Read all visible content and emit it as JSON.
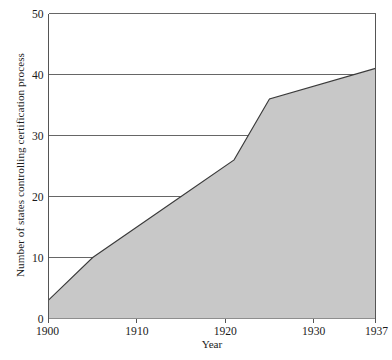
{
  "chart_data": {
    "type": "area",
    "title": "",
    "xlabel": "Year",
    "ylabel": "Number of states controlling certification process",
    "x": [
      1900,
      1905,
      1915,
      1921,
      1925,
      1937
    ],
    "values": [
      3,
      10,
      20,
      26,
      36,
      41
    ],
    "series": [
      {
        "name": "Number of states controlling certification process",
        "values": [
          3,
          10,
          20,
          26,
          36,
          41
        ]
      }
    ],
    "xlim": [
      1900,
      1937
    ],
    "ylim": [
      0,
      50
    ],
    "xticks": [
      1900,
      1910,
      1920,
      1930,
      1937
    ],
    "xtick_labels": [
      "1900",
      "1910",
      "1920",
      "1930",
      "1937"
    ],
    "yticks": [
      0,
      10,
      20,
      30,
      40,
      50
    ],
    "ytick_labels": [
      "0",
      "10",
      "20",
      "30",
      "40",
      "50"
    ],
    "grid": "horizontal",
    "legend": "none",
    "fill_color": "#c8c8c8",
    "line_color": "#3a3a3a",
    "axis_color": "#555555",
    "background": "#ffffff"
  }
}
